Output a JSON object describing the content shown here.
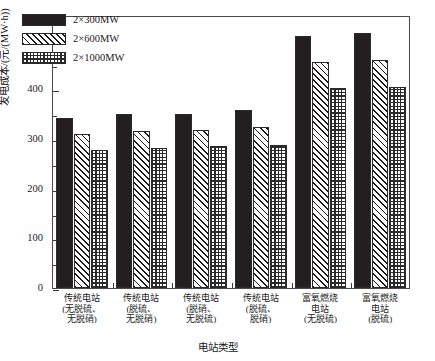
{
  "chart_data": {
    "type": "bar",
    "title": "",
    "xlabel": "电站类型",
    "ylabel": "发电成本/(元/(MW·h))",
    "ylim": [
      0,
      550
    ],
    "yticks": [
      0,
      100,
      200,
      300,
      400,
      500
    ],
    "ytick_labels": [
      "0",
      "100",
      "200",
      "300",
      "400",
      "500"
    ],
    "minor_tick_interval": 50,
    "grid": false,
    "legend_position": "upper-left",
    "categories": [
      "传统电站\n(无脱硫、\n无脱硝)",
      "传统电站\n(脱硫、\n无脱硝)",
      "传统电站\n(脱硝、\n无脱硫)",
      "传统电站\n(脱硫、\n脱硝)",
      "富氧燃烧\n电站\n(无脱硫)",
      "富氧燃烧\n电站\n(脱硫)"
    ],
    "series": [
      {
        "name": "2×300MW",
        "pattern": "solid-black",
        "values": [
          342,
          350,
          351,
          358,
          507,
          513
        ]
      },
      {
        "name": "2×600MW",
        "pattern": "diagonal-hatch",
        "values": [
          311,
          317,
          319,
          324,
          456,
          459
        ]
      },
      {
        "name": "2×1000MW",
        "pattern": "checkerboard",
        "values": [
          279,
          282,
          286,
          289,
          403,
          405
        ]
      }
    ],
    "colors": {
      "series_1": "#231f20",
      "series_2": "#ffffff",
      "series_3": "#ffffff",
      "axis": "#4a4a4a",
      "text": "#1a1a1a",
      "background": "#ffffff"
    }
  }
}
